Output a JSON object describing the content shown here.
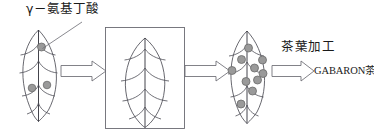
{
  "diagram": {
    "type": "process-flow",
    "background_color": "#ffffff",
    "stroke_color": "#4d4d55",
    "dot_fill_color": "#9a9a9a",
    "dot_stroke_color": "#6b6b6b",
    "labels": {
      "gaba": "γ－氨基丁酸",
      "tea_processing": "茶葉加工",
      "gabaron_tea": "GABARON茶"
    },
    "stages": [
      {
        "name": "fresh-leaf",
        "label": "",
        "dot_count": 3,
        "boxed": false,
        "dots": [
          {
            "cx": 41.5,
            "cy": 47.0,
            "r": 4.0
          },
          {
            "cx": 32.0,
            "cy": 88.0,
            "r": 3.8
          },
          {
            "cx": 47.0,
            "cy": 85.0,
            "r": 3.8
          }
        ]
      },
      {
        "name": "anaerobic-treatment-leaf",
        "label": "",
        "dot_count": 0,
        "boxed": true,
        "dots": []
      },
      {
        "name": "gaba-enriched-leaf",
        "label": "",
        "dot_count": 10,
        "boxed": false,
        "dots": [
          {
            "cx": 248.5,
            "cy": 48.0,
            "r": 4.0
          },
          {
            "cx": 241.5,
            "cy": 59.5,
            "r": 4.0
          },
          {
            "cx": 232.0,
            "cy": 70.5,
            "r": 4.0
          },
          {
            "cx": 254.5,
            "cy": 68.0,
            "r": 4.0
          },
          {
            "cx": 263.0,
            "cy": 73.5,
            "r": 4.0
          },
          {
            "cx": 246.0,
            "cy": 81.5,
            "r": 4.0
          },
          {
            "cx": 257.5,
            "cy": 80.0,
            "r": 4.0
          },
          {
            "cx": 252.5,
            "cy": 91.0,
            "r": 4.0
          },
          {
            "cx": 241.0,
            "cy": 104.0,
            "r": 4.0
          },
          {
            "cx": 262.5,
            "cy": 60.0,
            "r": 4.0
          }
        ]
      }
    ],
    "arrows": [
      {
        "name": "arrow-stage1-to-stage2",
        "x": 61,
        "y": 61,
        "width": 45,
        "height": 20
      },
      {
        "name": "arrow-stage2-to-stage3",
        "x": 185,
        "y": 61,
        "width": 45,
        "height": 20
      },
      {
        "name": "arrow-stage3-to-product",
        "x": 272,
        "y": 61,
        "width": 45,
        "height": 20
      }
    ],
    "leader_line": {
      "name": "gaba-pointer-line",
      "from_x": 82,
      "from_y": 22,
      "to_x": 43,
      "to_y": 48
    },
    "frame_box": {
      "x": 105,
      "y": 27,
      "width": 79,
      "height": 101
    }
  }
}
